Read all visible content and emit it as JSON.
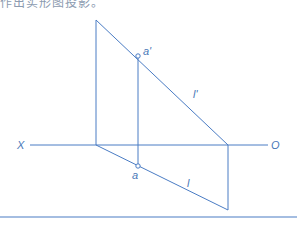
{
  "caption": "作出实形图投影。",
  "colors": {
    "line": "#4a7cc4",
    "label": "#4a78b8"
  },
  "labels": {
    "axis_left": "X",
    "axis_right": "O",
    "point_front": "a'",
    "point_top": "a",
    "line_front": "l'",
    "line_top": "l"
  },
  "geometry": {
    "axis": {
      "y": 145,
      "x1": 30,
      "x2": 268
    },
    "front_line_l_prime": {
      "x1": 96,
      "y1": 20,
      "x2": 228,
      "y2": 145
    },
    "top_line_l": {
      "x1": 96,
      "y1": 145,
      "x2": 228,
      "y2": 210
    },
    "left_vertical": {
      "x": 96,
      "y1": 20,
      "y2": 145
    },
    "right_vertical": {
      "x": 228,
      "y1": 145,
      "y2": 210
    },
    "projector_a": {
      "x": 138,
      "y1": 56,
      "y2": 166
    },
    "point_a_prime": {
      "x": 138,
      "y": 56
    },
    "point_a": {
      "x": 138,
      "y": 166
    },
    "bottom_rule": {
      "y": 217
    }
  }
}
